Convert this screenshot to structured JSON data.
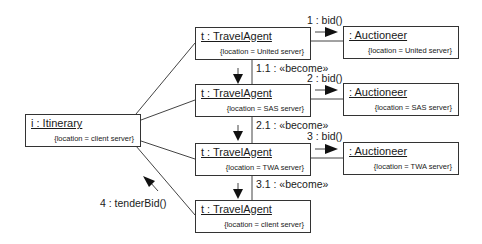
{
  "diagram": {
    "type": "UML collaboration diagram",
    "objects": [
      {
        "id": "itinerary",
        "name": "i : Itinerary",
        "location": "{location = client server}"
      },
      {
        "id": "ta1",
        "name": "t : TravelAgent",
        "location": "{location = United server}"
      },
      {
        "id": "ta2",
        "name": "t : TravelAgent",
        "location": "{location = SAS server}"
      },
      {
        "id": "ta3",
        "name": "t : TravelAgent",
        "location": "{location = TWA server}"
      },
      {
        "id": "ta4",
        "name": "t : TravelAgent",
        "location": "{location = client server}"
      },
      {
        "id": "au1",
        "name": ": Auctioneer",
        "location": "{location = United server}"
      },
      {
        "id": "au2",
        "name": ": Auctioneer",
        "location": "{location = SAS server}"
      },
      {
        "id": "au3",
        "name": ": Auctioneer",
        "location": "{location = TWA server}"
      }
    ],
    "messages": [
      {
        "label": "1 : bid()",
        "from": "ta1",
        "to": "au1"
      },
      {
        "label": "1.1 : «become»",
        "from": "ta1",
        "to": "ta2"
      },
      {
        "label": "2 : bid()",
        "from": "ta2",
        "to": "au2"
      },
      {
        "label": "2.1 : «become»",
        "from": "ta2",
        "to": "ta3"
      },
      {
        "label": "3 : bid()",
        "from": "ta3",
        "to": "au3"
      },
      {
        "label": "3.1 : «become»",
        "from": "ta3",
        "to": "ta4"
      },
      {
        "label": "4 : tenderBid()",
        "from": "ta4",
        "to": "itinerary"
      }
    ]
  }
}
